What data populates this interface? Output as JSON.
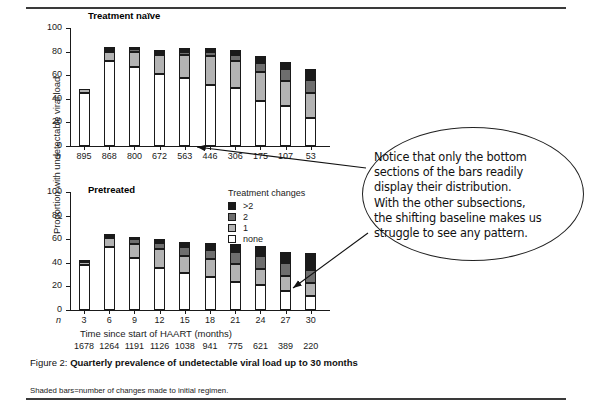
{
  "figure": {
    "caption_lead": "Figure 2:",
    "caption_bold": "Quarterly prevalence of undetectable viral load up to 30 months",
    "footnote": "Shaded bars=number of changes made to initial regimen."
  },
  "axes": {
    "ylabel": "Proportion with undetectable viral load",
    "xlabel": "Time since start of HAART (months)",
    "n_symbol": "n",
    "yticks": [
      "0",
      "20",
      "40",
      "60",
      "80",
      "100"
    ]
  },
  "legend": {
    "title": "Treatment changes",
    "items": [
      {
        "label": ">2",
        "color": "#1a1a1a"
      },
      {
        "label": "2",
        "color": "#6e6e6e"
      },
      {
        "label": "1",
        "color": "#b3b3b3"
      },
      {
        "label": "none",
        "color": "#ffffff"
      }
    ]
  },
  "callout": {
    "lines": [
      "Notice that only the bottom",
      "sections of the bars readily",
      "display their distribution.",
      "With the other subsections,",
      "the shifting baseline makes us",
      "struggle to see any pattern."
    ]
  },
  "chart_data": [
    {
      "type": "bar",
      "title": "Treatment naïve",
      "stacked": true,
      "xlabel": "Time since start of HAART (months)",
      "ylabel": "Proportion with undetectable viral load",
      "ylim": [
        0,
        100
      ],
      "yticks": [
        0,
        20,
        40,
        60,
        80,
        100
      ],
      "grid": false,
      "legend_position": "middle-right",
      "categories": [
        "3",
        "6",
        "9",
        "12",
        "15",
        "18",
        "21",
        "24",
        "27",
        "30"
      ],
      "n_label": "n",
      "n_values": [
        895,
        868,
        800,
        672,
        563,
        446,
        306,
        175,
        107,
        53
      ],
      "series": [
        {
          "name": "none",
          "color": "#ffffff",
          "values": [
            45,
            72,
            67,
            61,
            58,
            52,
            49,
            38,
            34,
            24
          ]
        },
        {
          "name": "1",
          "color": "#b3b3b3",
          "values": [
            3,
            8,
            13,
            16,
            19,
            24,
            23,
            25,
            21,
            21
          ]
        },
        {
          "name": "2",
          "color": "#6e6e6e",
          "values": [
            0,
            1,
            2,
            2,
            3,
            4,
            5,
            7,
            10,
            11
          ]
        },
        {
          "name": ">2",
          "color": "#1a1a1a",
          "values": [
            0,
            3,
            2,
            2,
            3,
            3,
            4,
            6,
            6,
            9
          ]
        }
      ],
      "totals": [
        48,
        84,
        84,
        81,
        83,
        83,
        81,
        76,
        71,
        65
      ]
    },
    {
      "type": "bar",
      "title": "Pretreated",
      "stacked": true,
      "xlabel": "Time since start of HAART (months)",
      "ylabel": "Proportion with undetectable viral load",
      "ylim": [
        0,
        100
      ],
      "yticks": [
        0,
        20,
        40,
        60,
        80,
        100
      ],
      "grid": false,
      "legend_position": "top-right",
      "categories": [
        "3",
        "6",
        "9",
        "12",
        "15",
        "18",
        "21",
        "24",
        "27",
        "30"
      ],
      "n_label": "n",
      "n_values": [
        1678,
        1264,
        1191,
        1126,
        1038,
        941,
        775,
        621,
        389,
        220
      ],
      "series": [
        {
          "name": "none",
          "color": "#ffffff",
          "values": [
            38,
            53,
            44,
            36,
            31,
            28,
            24,
            21,
            16,
            12
          ]
        },
        {
          "name": "1",
          "color": "#b3b3b3",
          "values": [
            3,
            8,
            12,
            16,
            15,
            15,
            15,
            14,
            13,
            11
          ]
        },
        {
          "name": "2",
          "color": "#6e6e6e",
          "values": [
            1,
            2,
            4,
            5,
            7,
            8,
            10,
            11,
            11,
            11
          ]
        },
        {
          "name": ">2",
          "color": "#1a1a1a",
          "values": [
            0,
            1,
            2,
            3,
            5,
            6,
            7,
            8,
            9,
            14
          ]
        }
      ],
      "totals": [
        42,
        64,
        62,
        60,
        58,
        57,
        56,
        54,
        49,
        48
      ]
    }
  ]
}
